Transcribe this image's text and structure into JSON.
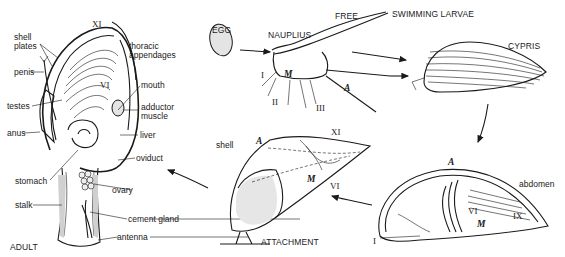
{
  "figure": {
    "stages": {
      "egg": "EGG",
      "nauplius": "NAUPLIUS",
      "free_swimming_1": "FREE",
      "free_swimming_2": "SWIMMING LARVAE",
      "cypris": "CYPRIS",
      "attachment": "ATTACHMENT",
      "adult": "ADULT"
    },
    "adult_labels": {
      "shell_plates": "shell\nplates",
      "penis": "penis",
      "testes": "testes",
      "anus": "anus",
      "stomach": "stomach",
      "stalk": "stalk",
      "thoracic_appendages": "thoracic\nappendages",
      "mouth": "mouth",
      "adductor_muscle": "adductor\nmuscle",
      "liver": "liver",
      "oviduct": "oviduct",
      "ovary": "ovary",
      "cement_gland": "cement gland",
      "antenna": "antenna",
      "roman_XI": "XI",
      "roman_VI": "VI"
    },
    "nauplius_labels": {
      "I": "I",
      "II": "II",
      "III": "III",
      "M": "M",
      "A": "A"
    },
    "attachment_labels": {
      "shell": "shell",
      "A": "A",
      "XI": "XI",
      "M": "M",
      "VI": "VI"
    },
    "cypris_settled_labels": {
      "A": "A",
      "abdomen": "abdomen",
      "VI": "VI",
      "M": "M",
      "IX": "IX",
      "I": "I"
    }
  }
}
